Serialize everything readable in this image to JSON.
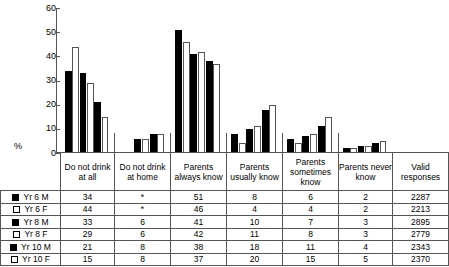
{
  "chart_data": {
    "type": "bar",
    "title": "",
    "xlabel": "",
    "ylabel": "%",
    "ylim": [
      0,
      60
    ],
    "yticks": [
      0,
      10,
      20,
      30,
      40,
      50,
      60
    ],
    "grid": false,
    "legend_position": "table-row-labels",
    "categories": [
      "Do not drink at all",
      "Do not drink at home",
      "Parents always know",
      "Parents usually know",
      "Parents sometimes know",
      "Parents never know"
    ],
    "series": [
      {
        "name": "Yr 6 M",
        "fill": "solid",
        "values": [
          34,
          null,
          51,
          8,
          6,
          2
        ]
      },
      {
        "name": "Yr 6 F",
        "fill": "hollow",
        "values": [
          44,
          null,
          46,
          4,
          4,
          2
        ]
      },
      {
        "name": "Yr 8 M",
        "fill": "solid",
        "values": [
          33,
          6,
          41,
          10,
          7,
          3
        ]
      },
      {
        "name": "Yr 8 F",
        "fill": "hollow",
        "values": [
          29,
          6,
          42,
          11,
          8,
          3
        ]
      },
      {
        "name": "Yr 10 M",
        "fill": "solid",
        "values": [
          21,
          8,
          38,
          18,
          11,
          4
        ]
      },
      {
        "name": "Yr 10 F",
        "fill": "hollow",
        "values": [
          15,
          8,
          37,
          20,
          15,
          5
        ]
      }
    ],
    "missing_marker": "*",
    "valid_responses": [
      2287,
      2213,
      2895,
      2779,
      2343,
      2370
    ]
  },
  "axis": {
    "percent_symbol": "%",
    "tick_labels": [
      "60",
      "50",
      "40",
      "30",
      "20",
      "10",
      "0"
    ]
  },
  "table": {
    "row_label_header": "",
    "column_headers": [
      "Do not drink at all",
      "Do not drink at home",
      "Parents always know",
      "Parents usually know",
      "Parents sometimes know",
      "Parents never know",
      "Valid responses"
    ],
    "rows": [
      {
        "label": "Yr 6 M",
        "swatch": "solid",
        "cells": [
          "34",
          "*",
          "51",
          "8",
          "6",
          "2",
          "2287"
        ]
      },
      {
        "label": "Yr 6 F",
        "swatch": "hollow",
        "cells": [
          "44",
          "*",
          "46",
          "4",
          "4",
          "2",
          "2213"
        ]
      },
      {
        "label": "Yr 8 M",
        "swatch": "solid",
        "cells": [
          "33",
          "6",
          "41",
          "10",
          "7",
          "3",
          "2895"
        ]
      },
      {
        "label": "Yr 8 F",
        "swatch": "hollow",
        "cells": [
          "29",
          "6",
          "42",
          "11",
          "8",
          "3",
          "2779"
        ]
      },
      {
        "label": "Yr 10 M",
        "swatch": "solid",
        "cells": [
          "21",
          "8",
          "38",
          "18",
          "11",
          "4",
          "2343"
        ]
      },
      {
        "label": "Yr 10 F",
        "swatch": "hollow",
        "cells": [
          "15",
          "8",
          "37",
          "20",
          "15",
          "5",
          "2370"
        ]
      }
    ]
  },
  "colors": {
    "solid_bar": "#000000",
    "hollow_bar": "#ffffff",
    "line": "#555555",
    "background": "#ffffff"
  }
}
